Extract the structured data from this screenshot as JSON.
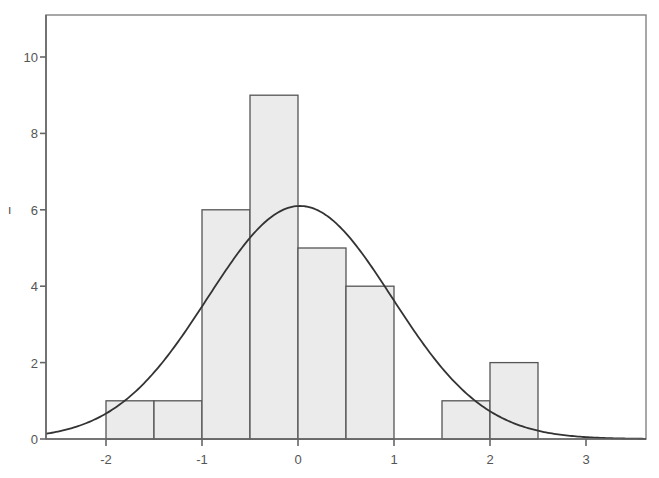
{
  "chart_data": {
    "type": "bar",
    "subtype": "histogram-with-normal-curve",
    "title": "",
    "xlabel": "",
    "ylabel": "Frequency",
    "ylabel_visible_fragment": "ı",
    "xlim": [
      -2.6,
      3.6
    ],
    "ylim": [
      0,
      11
    ],
    "x_ticks": [
      -2,
      -1,
      0,
      1,
      2,
      3
    ],
    "y_ticks": [
      0,
      2,
      4,
      6,
      8,
      10
    ],
    "grid": false,
    "legend": null,
    "bin_width": 0.5,
    "bins": [
      {
        "from": -2.0,
        "to": -1.5,
        "count": 1
      },
      {
        "from": -1.5,
        "to": -1.0,
        "count": 1
      },
      {
        "from": -1.0,
        "to": -0.5,
        "count": 6
      },
      {
        "from": -0.5,
        "to": 0.0,
        "count": 9
      },
      {
        "from": 0.0,
        "to": 0.5,
        "count": 5
      },
      {
        "from": 0.5,
        "to": 1.0,
        "count": 4
      },
      {
        "from": 1.0,
        "to": 1.5,
        "count": 0
      },
      {
        "from": 1.5,
        "to": 2.0,
        "count": 1
      },
      {
        "from": 2.0,
        "to": 2.5,
        "count": 2
      }
    ],
    "normal_curve": {
      "mean": 0.02,
      "sd": 0.96,
      "peak": 6.1
    },
    "colors": {
      "bar_fill": "#ebebeb",
      "bar_stroke": "#555555",
      "curve": "#333333",
      "axis": "#666666"
    }
  }
}
